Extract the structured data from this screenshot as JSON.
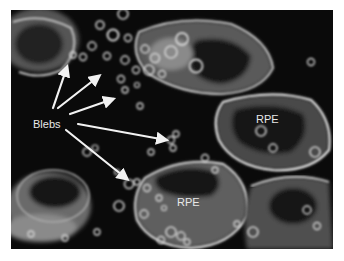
{
  "figure": {
    "labels": {
      "blebs": "Blebs",
      "rpe_upper": "RPE",
      "rpe_lower": "RPE"
    },
    "colors": {
      "background": "#0a0a0a",
      "page": "#ffffff",
      "label": "#e8e8e8",
      "arrow": "#f2f2f2",
      "membrane": "#d8d8d8",
      "cytoplasm": "#6e6e6e"
    },
    "arrows": [
      {
        "from": [
          42,
          98
        ],
        "to": [
          56,
          57
        ]
      },
      {
        "from": [
          47,
          98
        ],
        "to": [
          88,
          66
        ]
      },
      {
        "from": [
          59,
          104
        ],
        "to": [
          102,
          89
        ]
      },
      {
        "from": [
          67,
          114
        ],
        "to": [
          155,
          130
        ]
      },
      {
        "from": [
          55,
          120
        ],
        "to": [
          116,
          169
        ]
      }
    ]
  }
}
